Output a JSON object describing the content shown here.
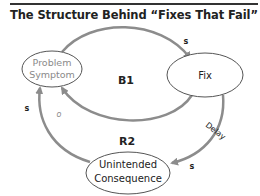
{
  "header": {
    "title": "The Structure Behind “Fixes That Fail”"
  },
  "diagram": {
    "type": "causal-loop",
    "nodes": {
      "problem_symptom": {
        "line1": "Problem",
        "line2": "Symptom",
        "color": "#8a8a8a"
      },
      "fix": {
        "label": "Fix",
        "color": "#222222"
      },
      "unintended_consequence": {
        "line1": "Unintended",
        "line2": "Consequence",
        "color": "#222222"
      }
    },
    "loops": {
      "b1": "B1",
      "r2": "R2"
    },
    "links": {
      "symptom_to_fix": "s",
      "fix_to_symptom": "o",
      "fix_to_consequence_delay": "Delay",
      "fix_to_consequence": "s",
      "consequence_to_symptom": "s"
    },
    "colors": {
      "arrow": "#8c8c8c",
      "ellipse_stroke": "#555555"
    }
  }
}
